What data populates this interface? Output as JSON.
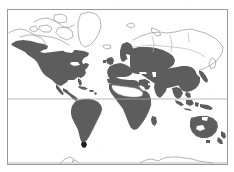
{
  "figure": {
    "kind": "world-distribution-map",
    "projection": "mercator",
    "caption": "",
    "background_color": "#ffffff",
    "frame": {
      "x": 7,
      "y": 9,
      "width": 221,
      "height": 156,
      "stroke_color": "#9a9a9a",
      "stroke_width": 1
    },
    "latitude_lines": [
      {
        "name": "equator",
        "y": 99,
        "stroke_color": "#a8a8a8"
      },
      {
        "name": "southern-parallel",
        "y": 163,
        "stroke_color": "#a8a8a8"
      }
    ],
    "colors": {
      "range_fill": "#5d5d5d",
      "range_fill_dark": "#1d1d1d",
      "coastline": "#8c8c8c",
      "coastline_light": "#b3b3b3",
      "frame": "#9a9a9a",
      "graticule": "#a8a8a8",
      "background": "#ffffff",
      "marginalia": "#cfcfcf"
    },
    "marginalia": [
      {
        "text": "(  ~  ,)",
        "x": 3,
        "y": 0
      },
      {
        "text": "·",
        "x": 120,
        "y": 2
      },
      {
        "text": "·",
        "x": 186,
        "y": 1
      }
    ],
    "legend": {
      "shaded_meaning": "shaded = species range / distribution",
      "unshaded_meaning": "unshaded = outside range"
    },
    "regions": [
      {
        "name": "north-america",
        "shaded": true
      },
      {
        "name": "greenland",
        "shaded": false
      },
      {
        "name": "arctic-archipelago",
        "shaded": false
      },
      {
        "name": "central-america",
        "shaded": true
      },
      {
        "name": "caribbean",
        "shaded": true
      },
      {
        "name": "south-america",
        "shaded": true
      },
      {
        "name": "tierra-del-fuego",
        "shaded": true
      },
      {
        "name": "europe",
        "shaded": true
      },
      {
        "name": "british-isles",
        "shaded": true
      },
      {
        "name": "scandinavia",
        "shaded": true
      },
      {
        "name": "iceland",
        "shaded": false
      },
      {
        "name": "north-africa-maghreb",
        "shaded": true
      },
      {
        "name": "sahara",
        "shaded": false
      },
      {
        "name": "sub-saharan-africa",
        "shaded": true
      },
      {
        "name": "madagascar",
        "shaded": true
      },
      {
        "name": "middle-east",
        "shaded": true
      },
      {
        "name": "south-asia",
        "shaded": true
      },
      {
        "name": "southeast-asia",
        "shaded": true
      },
      {
        "name": "east-asia",
        "shaded": true
      },
      {
        "name": "japan",
        "shaded": true
      },
      {
        "name": "siberia",
        "shaded": false
      },
      {
        "name": "indonesia",
        "shaded": true
      },
      {
        "name": "new-guinea",
        "shaded": true
      },
      {
        "name": "australia",
        "shaded": true
      },
      {
        "name": "new-zealand",
        "shaded": true
      },
      {
        "name": "antarctica",
        "shaded": false
      }
    ]
  }
}
